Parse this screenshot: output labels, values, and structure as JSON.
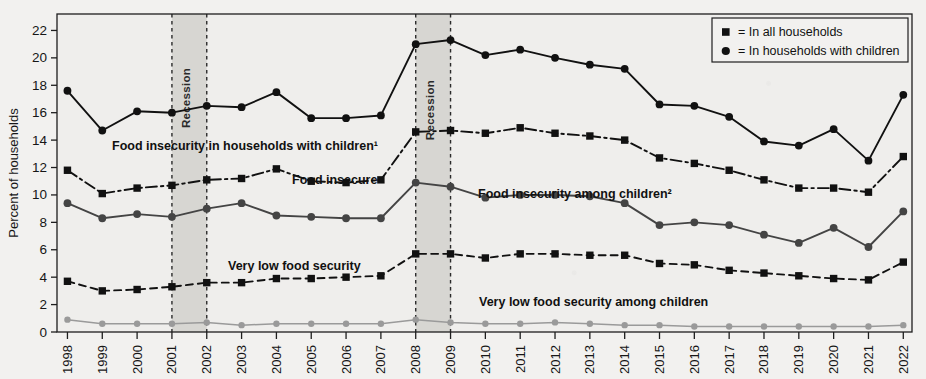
{
  "chart_data": {
    "type": "line",
    "title": "",
    "xlabel": "",
    "ylabel": "Percent of households",
    "ylim": [
      0,
      23.2
    ],
    "yticks": [
      0,
      2,
      4,
      6,
      8,
      10,
      12,
      14,
      16,
      18,
      20,
      22
    ],
    "grid": false,
    "legend_position": "top-right",
    "categories": [
      "1998",
      "1999",
      "2000",
      "2001",
      "2002",
      "2003",
      "2004",
      "2005",
      "2006",
      "2007",
      "2008",
      "2009",
      "2010",
      "2011",
      "2012",
      "2013",
      "2014",
      "2015",
      "2016",
      "2017",
      "2018",
      "2019",
      "2020",
      "2021",
      "2022"
    ],
    "series": [
      {
        "name": "Food insecurity in households with children",
        "label": "Food insecurity in households with children¹",
        "marker": "circle",
        "line_style": "solid",
        "color": "#111111",
        "values": [
          17.6,
          14.7,
          16.1,
          16.0,
          16.5,
          16.4,
          17.5,
          15.6,
          15.6,
          15.8,
          21.0,
          21.3,
          20.2,
          20.6,
          20.0,
          19.5,
          19.2,
          16.6,
          16.5,
          15.7,
          13.9,
          13.6,
          14.8,
          12.5,
          17.3
        ]
      },
      {
        "name": "Food insecure",
        "label": "Food insecure",
        "marker": "square",
        "line_style": "dashdot",
        "color": "#111111",
        "values": [
          11.8,
          10.1,
          10.5,
          10.7,
          11.1,
          11.2,
          11.9,
          11.0,
          10.9,
          11.1,
          14.6,
          14.7,
          14.5,
          14.9,
          14.5,
          14.3,
          14.0,
          12.7,
          12.3,
          11.8,
          11.1,
          10.5,
          10.5,
          10.2,
          12.8
        ]
      },
      {
        "name": "Food insecurity among children",
        "label": "Food insecurity among children²",
        "marker": "circle",
        "line_style": "solid",
        "color": "#444444",
        "values": [
          9.4,
          8.3,
          8.6,
          8.4,
          9.0,
          9.4,
          8.5,
          8.4,
          8.3,
          8.3,
          10.9,
          10.6,
          9.8,
          10.0,
          10.0,
          9.9,
          9.4,
          7.8,
          8.0,
          7.8,
          7.1,
          6.5,
          7.6,
          6.2,
          8.8
        ]
      },
      {
        "name": "Very low food security",
        "label": "Very low food security",
        "marker": "square",
        "line_style": "dashed",
        "color": "#111111",
        "values": [
          3.7,
          3.0,
          3.1,
          3.3,
          3.6,
          3.6,
          3.9,
          3.9,
          4.0,
          4.1,
          5.7,
          5.7,
          5.4,
          5.7,
          5.7,
          5.6,
          5.6,
          5.0,
          4.9,
          4.5,
          4.3,
          4.1,
          3.9,
          3.8,
          5.1
        ]
      },
      {
        "name": "Very low food security among children",
        "label": "Very low food security among children",
        "marker": "circle",
        "line_style": "solid",
        "color": "#9a9a9a",
        "values": [
          0.9,
          0.6,
          0.6,
          0.6,
          0.7,
          0.5,
          0.6,
          0.6,
          0.6,
          0.6,
          0.9,
          0.7,
          0.6,
          0.6,
          0.7,
          0.6,
          0.5,
          0.5,
          0.4,
          0.4,
          0.4,
          0.4,
          0.4,
          0.4,
          0.5
        ]
      }
    ],
    "annotations": [
      {
        "id": "recession-1",
        "label": "Recession",
        "start": "2001",
        "end": "2002"
      },
      {
        "id": "recession-2",
        "label": "Recession",
        "start": "2008",
        "end": "2009"
      }
    ]
  },
  "axis": {
    "y_title": "Percent of households"
  },
  "legend": {
    "items": [
      {
        "marker": "square",
        "text": "= In all households"
      },
      {
        "marker": "circle",
        "text": "= In households with children"
      }
    ]
  },
  "series_labels": {
    "top_line": "Food insecurity in households with children¹",
    "food_insecure": "Food insecure",
    "children": "Food insecurity among children²",
    "very_low": "Very low food security",
    "very_low_children": "Very low food security among children"
  },
  "recession": {
    "label_1": "Recession",
    "label_2": "Recession"
  }
}
